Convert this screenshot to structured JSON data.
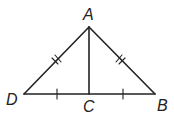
{
  "diagram": {
    "type": "triangle-geometry",
    "points": {
      "A": {
        "label": "A",
        "x": 89,
        "y": 27
      },
      "B": {
        "label": "B",
        "x": 155,
        "y": 94
      },
      "C": {
        "label": "C",
        "x": 89,
        "y": 94
      },
      "D": {
        "label": "D",
        "x": 24,
        "y": 94
      }
    },
    "segments": [
      "AD",
      "AB",
      "DB",
      "AC"
    ],
    "congruence_marks": {
      "double_ticks": [
        "AD",
        "AB"
      ],
      "single_ticks": [
        "DC",
        "CB"
      ]
    },
    "colors": {
      "stroke": "#222222",
      "background": "#ffffff"
    }
  }
}
